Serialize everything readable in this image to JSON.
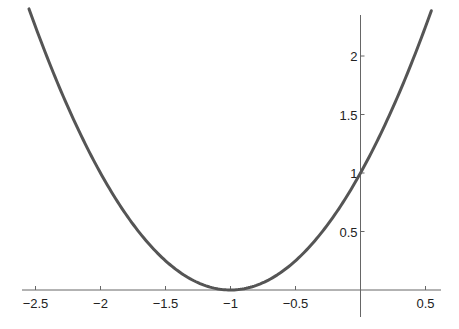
{
  "chart_data": {
    "type": "line",
    "title": "",
    "xlabel": "",
    "ylabel": "",
    "function": "y = (x + 1)^2",
    "xlim": [
      -2.6,
      0.6
    ],
    "ylim": [
      0,
      2.4
    ],
    "grid": false,
    "legend": null,
    "x_ticks": [
      -2.5,
      -2,
      -1.5,
      -1,
      -0.5,
      0.5
    ],
    "x_tick_labels": [
      "−2.5",
      "−2",
      "−1.5",
      "−1",
      "−0.5",
      "0.5"
    ],
    "y_ticks": [
      0.5,
      1,
      1.5,
      2
    ],
    "y_tick_labels": [
      "0.5",
      "1",
      "1.5",
      "2"
    ],
    "series": [
      {
        "name": "(x+1)^2",
        "color": "#555555",
        "x": [
          -2.55,
          -2.5,
          -2.25,
          -2.0,
          -1.75,
          -1.5,
          -1.25,
          -1.0,
          -0.75,
          -0.5,
          -0.25,
          0.0,
          0.25,
          0.5,
          0.545
        ],
        "y": [
          2.4025,
          2.25,
          1.5625,
          1.0,
          0.5625,
          0.25,
          0.0625,
          0.0,
          0.0625,
          0.25,
          0.5625,
          1.0,
          1.5625,
          2.25,
          2.387
        ]
      }
    ],
    "x_range_plotted": [
      -2.55,
      0.545
    ]
  },
  "style": {
    "curve_color": "#555555",
    "axis_color": "#666666",
    "label_color": "#222222"
  }
}
